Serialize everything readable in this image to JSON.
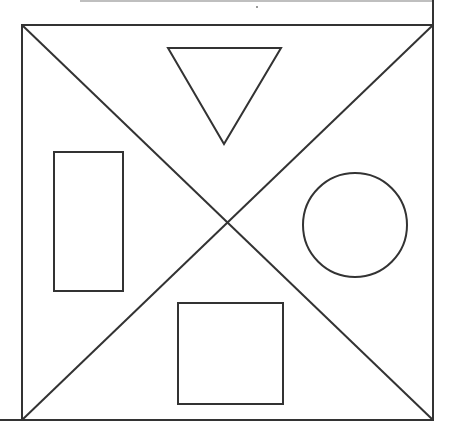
{
  "diagram": {
    "title": "",
    "stroke_color": "#333333",
    "background": "#ffffff",
    "frame": {
      "x1": 22,
      "y1": 25,
      "x2": 433,
      "y2": 420
    },
    "center": {
      "x": 227,
      "y": 224
    },
    "shapes": [
      {
        "name": "triangle",
        "region": "top",
        "points": [
          [
            168,
            48
          ],
          [
            281,
            48
          ],
          [
            224,
            144
          ]
        ]
      },
      {
        "name": "rectangle",
        "region": "left",
        "x": 54,
        "y": 152,
        "width": 69,
        "height": 139
      },
      {
        "name": "circle",
        "region": "right",
        "cx": 355,
        "cy": 225,
        "r": 52
      },
      {
        "name": "square",
        "region": "bottom",
        "x": 178,
        "y": 303,
        "width": 105,
        "height": 101
      }
    ]
  }
}
